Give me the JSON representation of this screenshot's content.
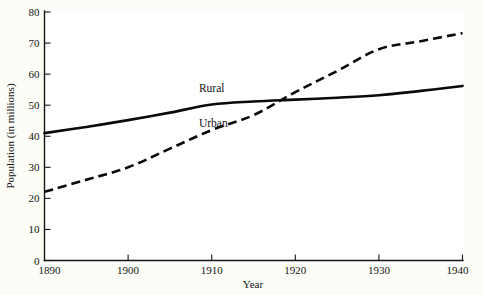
{
  "chart_data": {
    "type": "line",
    "title": "",
    "xlabel": "Year",
    "ylabel": "Population (in millions)",
    "xlim": [
      1890,
      1940
    ],
    "ylim": [
      0,
      80
    ],
    "grid": false,
    "legend_position": "inline-annotations",
    "x_ticks": [
      1890,
      1900,
      1910,
      1920,
      1930,
      1940
    ],
    "x_tick_labels": [
      "1890",
      "1900",
      "1910",
      "1920",
      "1930",
      "1940"
    ],
    "y_ticks": [
      0,
      10,
      20,
      30,
      40,
      50,
      60,
      70,
      80
    ],
    "y_tick_labels": [
      "0",
      "10",
      "20",
      "30",
      "40",
      "50",
      "60",
      "70",
      "80"
    ],
    "x": [
      1890,
      1895,
      1900,
      1905,
      1910,
      1915,
      1920,
      1925,
      1930,
      1935,
      1940
    ],
    "series": [
      {
        "name": "Rural",
        "style": "solid",
        "color": "#0a0a0a",
        "values": [
          41.0,
          43.0,
          45.2,
          47.6,
          50.2,
          51.2,
          51.8,
          52.4,
          53.2,
          54.6,
          56.2
        ]
      },
      {
        "name": "Urban",
        "style": "dashed",
        "color": "#0a0a0a",
        "values": [
          22.1,
          26.0,
          30.0,
          36.0,
          42.0,
          46.8,
          54.2,
          61.0,
          68.0,
          70.6,
          73.2
        ]
      }
    ],
    "annotations": [
      {
        "text": "Rural",
        "x": 1910.0,
        "y": 54.2
      },
      {
        "text": "Urban",
        "x": 1910.2,
        "y": 43.0
      }
    ]
  }
}
